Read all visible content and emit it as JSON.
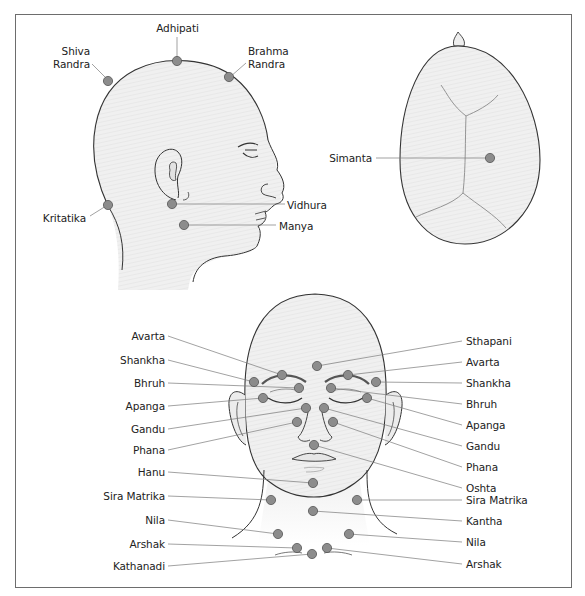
{
  "diagram": {
    "colors": {
      "frame": "#6d6d6d",
      "outline": "#333333",
      "fill": "#eeeeee",
      "dot": "#8c8c8c",
      "dot_stroke": "#555555",
      "leader": "#7a7a7a",
      "suture": "#8a8a8a"
    },
    "side_view": {
      "labels": {
        "adhipati": "Adhipati",
        "shiva_randra_1": "Shiva",
        "shiva_randra_2": "Randra",
        "brahma_randra_1": "Brahma",
        "brahma_randra_2": "Randra",
        "kritatika": "Kritatika",
        "vidhura": "Vidhura",
        "manya": "Manya"
      }
    },
    "top_view": {
      "labels": {
        "simanta": "Simanta"
      }
    },
    "front_view": {
      "left_labels": [
        "Avarta",
        "Shankha",
        "Bhruh",
        "Apanga",
        "Gandu",
        "Phana",
        "Hanu",
        "Sira Matrika",
        "Nila",
        "Arshak",
        "Kathanadi"
      ],
      "right_labels": [
        "Sthapani",
        "Avarta",
        "Shankha",
        "Bhruh",
        "Apanga",
        "Gandu",
        "Phana",
        "Oshta",
        "Sira Matrika",
        "Kantha",
        "Nila",
        "Arshak"
      ]
    }
  }
}
